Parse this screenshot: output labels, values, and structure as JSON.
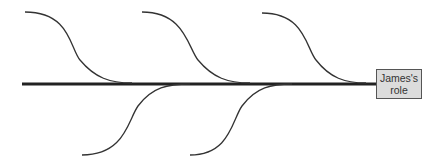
{
  "diagram": {
    "type": "fishbone",
    "head": {
      "line1": "James's",
      "line2": "role"
    },
    "colors": {
      "line": "#222222",
      "box_fill": "#dcdcdc",
      "box_border": "#555555",
      "text": "#333333"
    },
    "spine": {
      "x1": 22,
      "y1": 84,
      "x2": 376,
      "y2": 84
    },
    "bones_top": [
      {
        "start": [
          25,
          12
        ],
        "end": [
          132,
          83
        ]
      },
      {
        "start": [
          142,
          12
        ],
        "end": [
          250,
          83
        ]
      },
      {
        "start": [
          262,
          13
        ],
        "end": [
          366,
          83
        ]
      }
    ],
    "bones_bottom": [
      {
        "start": [
          82,
          155
        ],
        "end": [
          190,
          84
        ]
      },
      {
        "start": [
          190,
          155
        ],
        "end": [
          292,
          84
        ]
      }
    ]
  }
}
